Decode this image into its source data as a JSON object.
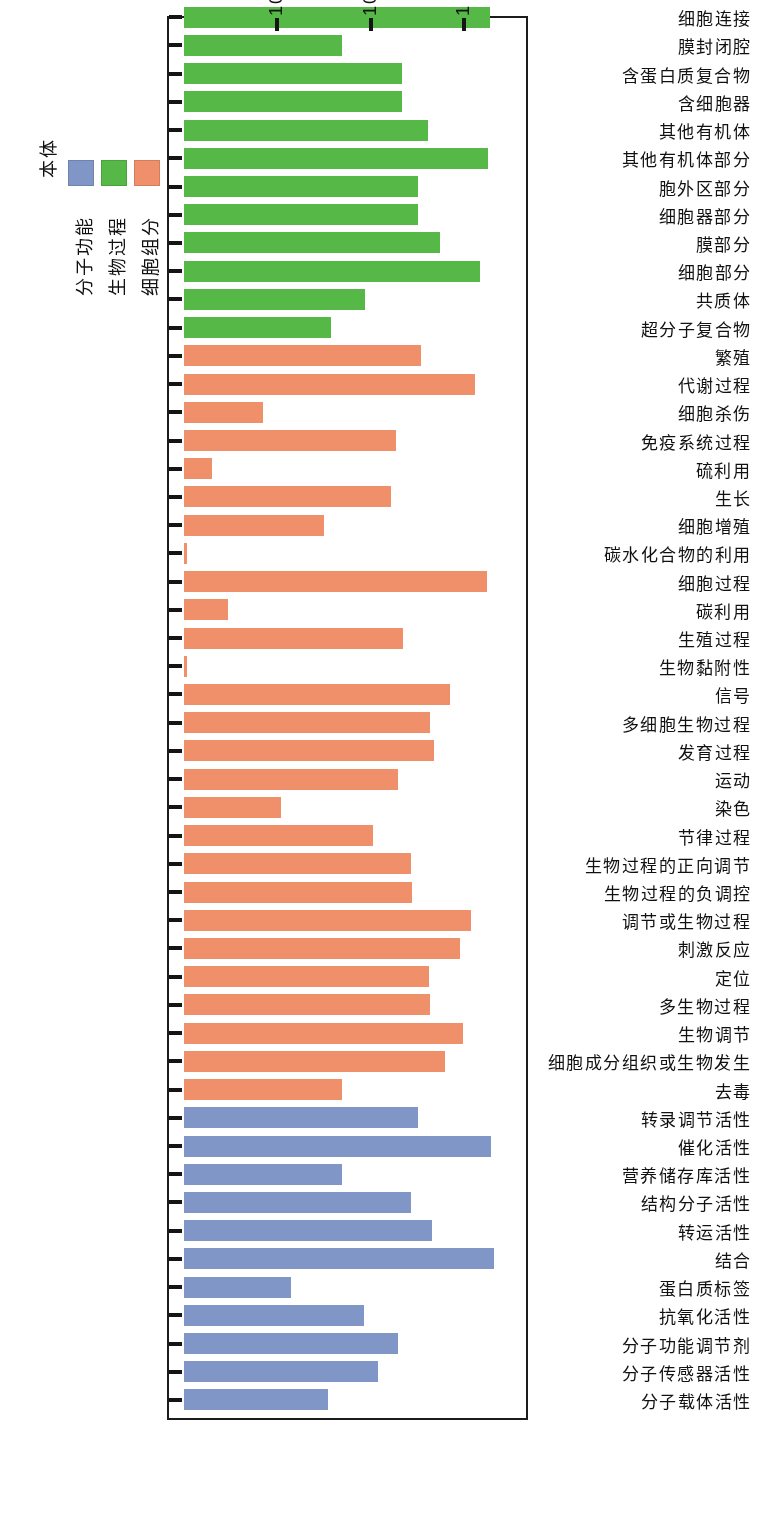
{
  "chart_data": {
    "type": "bar",
    "orientation": "horizontal",
    "title": "",
    "xlabel": "基因数量",
    "ylabel": "",
    "xscale": "log",
    "xticks": [
      "1 000",
      "100",
      "10"
    ],
    "xtick_values": [
      1000,
      100,
      10
    ],
    "xlim": [
      1,
      2200
    ],
    "grid": false,
    "legend_position": "left-outside",
    "note": "Scanned figure printed upside-down; bars extend leftwards from a baseline at value 1 on a log axis.",
    "series": [
      {
        "name": "分子功能",
        "color": "#8096c6",
        "categories": [
          "分子载体活性",
          "分子传感器活性",
          "分子功能调节剂",
          "抗氧化活性",
          "蛋白质标签",
          "结合",
          "转运活性",
          "结构分子活性",
          "营养储存库活性",
          "催化活性",
          "转录调节活性"
        ],
        "values": [
          35,
          120,
          195,
          85,
          14,
          2100,
          460,
          270,
          50,
          1950,
          320
        ]
      },
      {
        "name": "生物过程",
        "color": "#f0906a",
        "categories": [
          "去毒",
          "细胞成分组织或生物发生",
          "生物调节",
          "多生物过程",
          "定位",
          "刺激反应",
          "调节或生物过程",
          "生物过程的负调控",
          "生物过程的正向调节",
          "节律过程",
          "染色",
          "运动",
          "发育过程",
          "多细胞生物过程",
          "信号",
          "生物黏附性",
          "生殖过程",
          "碳利用",
          "细胞过程",
          "碳水化合物的利用",
          "细胞增殖",
          "生长",
          "硫利用",
          "免疫系统过程",
          "细胞杀伤",
          "代谢过程",
          "繁殖"
        ],
        "values": [
          50,
          620,
          990,
          430,
          420,
          900,
          1180,
          280,
          270,
          105,
          11,
          195,
          480,
          430,
          710,
          1,
          220,
          3,
          1750,
          1,
          32,
          165,
          2,
          185,
          7,
          1300,
          350
        ]
      },
      {
        "name": "细胞组分",
        "color": "#56b846",
        "categories": [
          "超分子复合物",
          "共质体",
          "细胞部分",
          "膜部分",
          "细胞器部分",
          "胞外区部分",
          "其他有机体部分",
          "其他有机体",
          "含细胞器",
          "含蛋白质复合物",
          "膜封闭腔",
          "细胞连接",
          "拟核",
          "细胞",
          "胞外区",
          "薄膜"
        ],
        "values": [
          38,
          88,
          1500,
          560,
          320,
          320,
          1800,
          410,
          215,
          215,
          50,
          1900,
          280,
          160,
          160,
          1270
        ]
      }
    ]
  },
  "legend": {
    "title": "本体",
    "items": [
      {
        "label": "细胞组分",
        "color": "#f0906a"
      },
      {
        "label": "生物过程",
        "color": "#56b846"
      },
      {
        "label": "分子功能",
        "color": "#8096c6"
      }
    ]
  },
  "axis": {
    "value_title": "基因数量",
    "ticks": [
      "1 000",
      "100",
      "10"
    ]
  }
}
